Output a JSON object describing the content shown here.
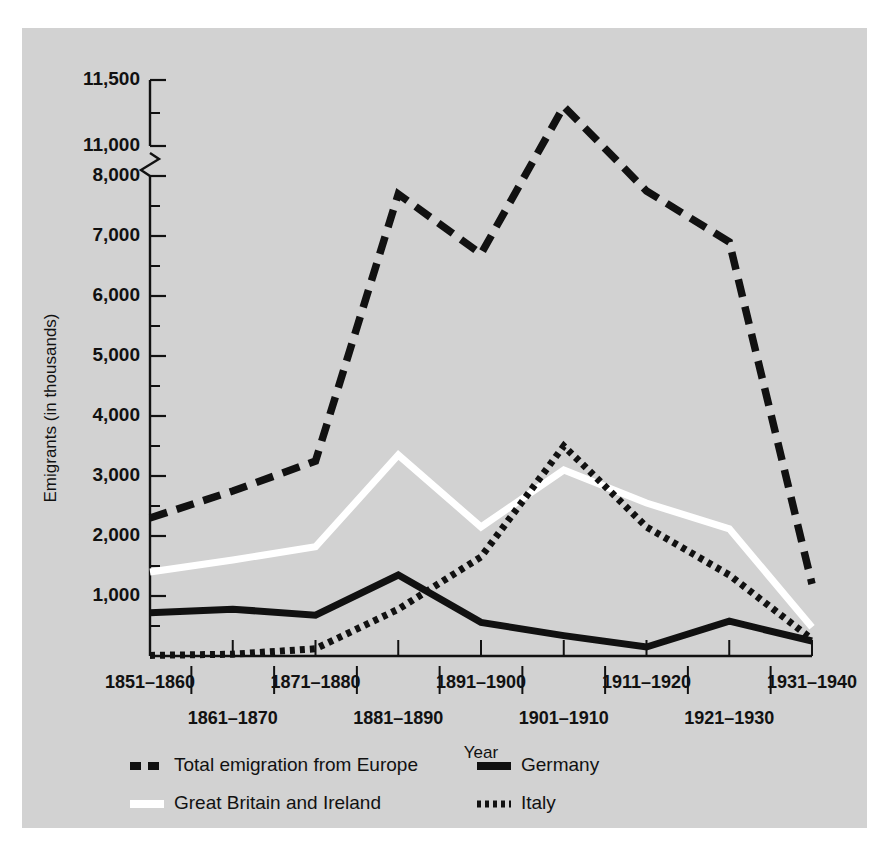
{
  "chart_data": {
    "type": "line",
    "title": "",
    "xlabel": "Year",
    "ylabel": "Emigrants (in thousands)",
    "categories": [
      "1851–1860",
      "1861–1870",
      "1871–1880",
      "1881–1890",
      "1891–1900",
      "1901–1910",
      "1911–1920",
      "1921–1930",
      "1931–1940"
    ],
    "x_tick_labels_row1": [
      "1851–1860",
      "1871–1880",
      "1891–1900",
      "1911–1920",
      "1931–1940"
    ],
    "x_tick_labels_row2": [
      "1861–1870",
      "1881–1890",
      "1901–1910",
      "1921–1930"
    ],
    "y_tick_labels": [
      "1,000",
      "2,000",
      "3,000",
      "4,000",
      "5,000",
      "6,000",
      "7,000",
      "8,000",
      "11,000",
      "11,500"
    ],
    "y_axis_break": true,
    "y_break_between": [
      8000,
      11000
    ],
    "ylim": [
      0,
      11500
    ],
    "minor_tick_step": 500,
    "grid": false,
    "legend_position": "bottom",
    "series": [
      {
        "name": "Total emigration from Europe",
        "style": "dashed",
        "color": "#111111",
        "values": [
          2300,
          2750,
          3250,
          7700,
          6700,
          11300,
          7750,
          6900,
          1200
        ]
      },
      {
        "name": "Great Britain and Ireland",
        "style": "solid",
        "color": "#ffffff",
        "values": [
          1400,
          1600,
          1820,
          3350,
          2150,
          3100,
          2550,
          2120,
          480
        ]
      },
      {
        "name": "Germany",
        "style": "solid",
        "color": "#111111",
        "values": [
          720,
          780,
          680,
          1350,
          560,
          340,
          150,
          580,
          250
        ]
      },
      {
        "name": "Italy",
        "style": "dotted",
        "color": "#111111",
        "values": [
          10,
          30,
          120,
          780,
          1650,
          3500,
          2150,
          1350,
          280
        ]
      }
    ]
  },
  "legend": {
    "items": [
      {
        "label": "Total emigration from Europe",
        "style": "dashed",
        "color": "#111111"
      },
      {
        "label": "Germany",
        "style": "solid",
        "color": "#111111"
      },
      {
        "label": "Great Britain and Ireland",
        "style": "solid",
        "color": "#ffffff"
      },
      {
        "label": "Italy",
        "style": "dotted",
        "color": "#111111"
      }
    ]
  },
  "colors": {
    "panel_background": "#d2d2d2",
    "page_background": "#ffffff",
    "ink": "#111111",
    "highlight": "#ffffff"
  }
}
